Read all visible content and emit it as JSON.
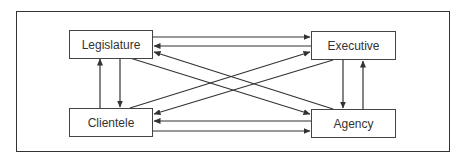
{
  "diagram": {
    "type": "flow",
    "nodes": [
      {
        "id": "legislature",
        "label": "Legislature"
      },
      {
        "id": "executive",
        "label": "Executive"
      },
      {
        "id": "clientele",
        "label": "Clientele"
      },
      {
        "id": "agency",
        "label": "Agency"
      }
    ],
    "edges": [
      {
        "from": "legislature",
        "to": "executive"
      },
      {
        "from": "executive",
        "to": "legislature"
      },
      {
        "from": "clientele",
        "to": "agency"
      },
      {
        "from": "agency",
        "to": "clientele"
      },
      {
        "from": "legislature",
        "to": "clientele"
      },
      {
        "from": "clientele",
        "to": "legislature"
      },
      {
        "from": "executive",
        "to": "agency"
      },
      {
        "from": "agency",
        "to": "executive"
      },
      {
        "from": "legislature",
        "to": "agency"
      },
      {
        "from": "agency",
        "to": "legislature"
      },
      {
        "from": "clientele",
        "to": "executive"
      },
      {
        "from": "executive",
        "to": "clientele"
      }
    ],
    "colors": {
      "line": "#333333",
      "box_border": "#444444",
      "text": "#333333"
    }
  }
}
